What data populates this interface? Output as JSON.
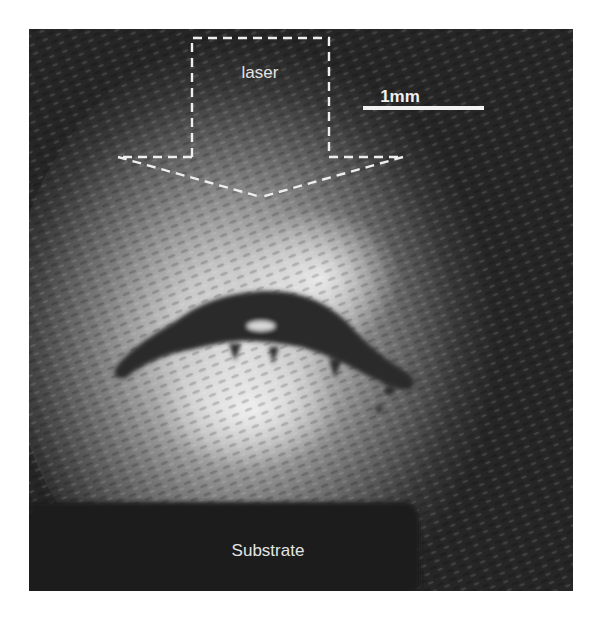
{
  "figure": {
    "type": "photograph with annotations",
    "colors": {
      "background_dark": "#262626",
      "illumination_bright": "#e8e8e8",
      "annotation": "#f0f0f0",
      "substrate": "#1c1c1c"
    }
  },
  "annotations": {
    "laser_label": "laser",
    "scale_bar_label": "1mm",
    "substrate_label": "Substrate"
  },
  "icons": {
    "laser_arrow": "dashed-down-arrow-icon",
    "scale_bar": "scale-bar"
  }
}
